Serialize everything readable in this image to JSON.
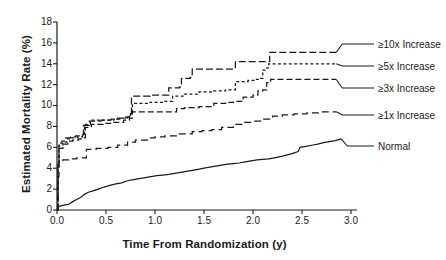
{
  "chart_data": {
    "type": "line",
    "title": "",
    "xlabel": "Time From Randomization (y)",
    "ylabel": "Estimated Mortality Rate (%)",
    "xlim": [
      0.0,
      3.0
    ],
    "ylim": [
      0,
      18
    ],
    "xticks": [
      "0.0",
      "0.5",
      "1.0",
      "1.5",
      "2.0",
      "2.5",
      "3.0"
    ],
    "yticks": [
      "0",
      "2",
      "4",
      "6",
      "8",
      "10",
      "12",
      "14",
      "16",
      "18"
    ],
    "grid": false,
    "legend_position": "right-inline-end-labels",
    "color": "#1a1a1a",
    "series": [
      {
        "name": "≥10x Increase",
        "label": "≥10x Increase",
        "dash": "7,3",
        "end_value": 15.1,
        "end_x": 2.85,
        "points": [
          [
            0.0,
            0.0
          ],
          [
            0.01,
            4.5
          ],
          [
            0.02,
            6.4
          ],
          [
            0.05,
            6.6
          ],
          [
            0.09,
            6.9
          ],
          [
            0.14,
            7.0
          ],
          [
            0.19,
            7.1
          ],
          [
            0.26,
            7.2
          ],
          [
            0.27,
            8.1
          ],
          [
            0.33,
            8.5
          ],
          [
            0.45,
            8.6
          ],
          [
            0.55,
            8.7
          ],
          [
            0.62,
            8.8
          ],
          [
            0.7,
            8.9
          ],
          [
            0.74,
            9.2
          ],
          [
            0.76,
            10.9
          ],
          [
            0.95,
            11.0
          ],
          [
            1.12,
            11.0
          ],
          [
            1.14,
            11.7
          ],
          [
            1.25,
            11.8
          ],
          [
            1.27,
            12.6
          ],
          [
            1.36,
            12.7
          ],
          [
            1.38,
            13.5
          ],
          [
            1.6,
            13.5
          ],
          [
            1.8,
            13.5
          ],
          [
            1.82,
            14.2
          ],
          [
            2.05,
            14.2
          ],
          [
            2.15,
            14.2
          ],
          [
            2.17,
            15.1
          ],
          [
            2.45,
            15.1
          ],
          [
            2.7,
            15.1
          ],
          [
            2.85,
            15.1
          ]
        ]
      },
      {
        "name": "≥5x Increase",
        "label": "≥5x Increase",
        "dash": "3,2.4",
        "end_value": 14.0,
        "end_x": 2.85,
        "points": [
          [
            0.0,
            0.0
          ],
          [
            0.01,
            4.3
          ],
          [
            0.02,
            6.2
          ],
          [
            0.06,
            6.5
          ],
          [
            0.1,
            6.8
          ],
          [
            0.15,
            6.9
          ],
          [
            0.21,
            7.0
          ],
          [
            0.26,
            7.1
          ],
          [
            0.28,
            8.2
          ],
          [
            0.34,
            8.6
          ],
          [
            0.46,
            8.6
          ],
          [
            0.58,
            8.7
          ],
          [
            0.66,
            8.8
          ],
          [
            0.72,
            8.9
          ],
          [
            0.75,
            9.3
          ],
          [
            0.77,
            10.2
          ],
          [
            0.95,
            10.3
          ],
          [
            1.1,
            10.4
          ],
          [
            1.18,
            10.9
          ],
          [
            1.3,
            11.1
          ],
          [
            1.45,
            11.3
          ],
          [
            1.6,
            11.4
          ],
          [
            1.72,
            11.5
          ],
          [
            1.8,
            11.5
          ],
          [
            1.82,
            12.3
          ],
          [
            1.95,
            12.4
          ],
          [
            2.02,
            12.5
          ],
          [
            2.08,
            12.6
          ],
          [
            2.1,
            13.4
          ],
          [
            2.14,
            13.6
          ],
          [
            2.16,
            14.0
          ],
          [
            2.4,
            14.0
          ],
          [
            2.65,
            14.0
          ],
          [
            2.85,
            14.0
          ]
        ]
      },
      {
        "name": "≥3x Increase",
        "label": "≥3x Increase",
        "dash": "6,3",
        "end_value": 12.5,
        "end_x": 2.85,
        "points": [
          [
            0.0,
            0.0
          ],
          [
            0.01,
            4.0
          ],
          [
            0.02,
            5.9
          ],
          [
            0.06,
            6.3
          ],
          [
            0.11,
            6.6
          ],
          [
            0.16,
            6.7
          ],
          [
            0.22,
            6.8
          ],
          [
            0.26,
            6.9
          ],
          [
            0.29,
            7.9
          ],
          [
            0.35,
            8.2
          ],
          [
            0.47,
            8.3
          ],
          [
            0.58,
            8.4
          ],
          [
            0.68,
            8.6
          ],
          [
            0.74,
            8.8
          ],
          [
            0.77,
            9.4
          ],
          [
            1.0,
            9.4
          ],
          [
            1.12,
            9.4
          ],
          [
            1.22,
            9.7
          ],
          [
            1.3,
            9.8
          ],
          [
            1.45,
            9.9
          ],
          [
            1.6,
            10.2
          ],
          [
            1.72,
            10.3
          ],
          [
            1.8,
            10.4
          ],
          [
            1.9,
            10.8
          ],
          [
            2.0,
            11.0
          ],
          [
            2.05,
            11.4
          ],
          [
            2.1,
            11.5
          ],
          [
            2.14,
            12.2
          ],
          [
            2.18,
            12.5
          ],
          [
            2.45,
            12.5
          ],
          [
            2.7,
            12.5
          ],
          [
            2.85,
            12.5
          ]
        ]
      },
      {
        "name": "≥1x Increase",
        "label": "≥1x Increase",
        "dash": "7,4",
        "end_value": 9.4,
        "end_x": 2.85,
        "points": [
          [
            0.0,
            0.0
          ],
          [
            0.01,
            3.2
          ],
          [
            0.02,
            4.6
          ],
          [
            0.06,
            4.8
          ],
          [
            0.12,
            4.9
          ],
          [
            0.2,
            5.0
          ],
          [
            0.27,
            5.0
          ],
          [
            0.3,
            5.8
          ],
          [
            0.4,
            5.9
          ],
          [
            0.52,
            6.0
          ],
          [
            0.62,
            6.2
          ],
          [
            0.72,
            6.5
          ],
          [
            0.8,
            6.7
          ],
          [
            0.92,
            6.9
          ],
          [
            1.0,
            7.0
          ],
          [
            1.1,
            7.1
          ],
          [
            1.25,
            7.3
          ],
          [
            1.38,
            7.5
          ],
          [
            1.48,
            7.6
          ],
          [
            1.58,
            7.7
          ],
          [
            1.68,
            7.9
          ],
          [
            1.8,
            8.2
          ],
          [
            1.9,
            8.4
          ],
          [
            2.0,
            8.5
          ],
          [
            2.1,
            8.7
          ],
          [
            2.2,
            9.0
          ],
          [
            2.3,
            9.1
          ],
          [
            2.42,
            9.2
          ],
          [
            2.55,
            9.3
          ],
          [
            2.7,
            9.4
          ],
          [
            2.85,
            9.4
          ]
        ]
      },
      {
        "name": "Normal",
        "label": "Normal",
        "dash": "none",
        "end_value": 6.8,
        "end_x": 2.9,
        "points": [
          [
            0.0,
            0.0
          ],
          [
            0.01,
            0.3
          ],
          [
            0.04,
            0.4
          ],
          [
            0.08,
            0.5
          ],
          [
            0.12,
            0.55
          ],
          [
            0.16,
            0.8
          ],
          [
            0.2,
            1.0
          ],
          [
            0.24,
            1.2
          ],
          [
            0.28,
            1.5
          ],
          [
            0.32,
            1.7
          ],
          [
            0.36,
            1.8
          ],
          [
            0.42,
            2.0
          ],
          [
            0.48,
            2.2
          ],
          [
            0.54,
            2.35
          ],
          [
            0.6,
            2.5
          ],
          [
            0.66,
            2.6
          ],
          [
            0.72,
            2.8
          ],
          [
            0.78,
            2.9
          ],
          [
            0.84,
            3.0
          ],
          [
            0.9,
            3.1
          ],
          [
            0.96,
            3.2
          ],
          [
            1.02,
            3.3
          ],
          [
            1.08,
            3.35
          ],
          [
            1.14,
            3.4
          ],
          [
            1.2,
            3.5
          ],
          [
            1.26,
            3.6
          ],
          [
            1.32,
            3.7
          ],
          [
            1.38,
            3.8
          ],
          [
            1.44,
            3.9
          ],
          [
            1.5,
            4.0
          ],
          [
            1.56,
            4.1
          ],
          [
            1.62,
            4.2
          ],
          [
            1.68,
            4.3
          ],
          [
            1.74,
            4.4
          ],
          [
            1.8,
            4.45
          ],
          [
            1.86,
            4.5
          ],
          [
            1.92,
            4.6
          ],
          [
            1.98,
            4.7
          ],
          [
            2.04,
            4.8
          ],
          [
            2.1,
            4.85
          ],
          [
            2.16,
            4.9
          ],
          [
            2.22,
            5.0
          ],
          [
            2.28,
            5.1
          ],
          [
            2.34,
            5.25
          ],
          [
            2.4,
            5.4
          ],
          [
            2.46,
            5.6
          ],
          [
            2.48,
            6.0
          ],
          [
            2.54,
            6.1
          ],
          [
            2.6,
            6.2
          ],
          [
            2.66,
            6.3
          ],
          [
            2.72,
            6.45
          ],
          [
            2.78,
            6.55
          ],
          [
            2.84,
            6.65
          ],
          [
            2.9,
            6.8
          ]
        ]
      }
    ]
  },
  "axis": {
    "x_title": "Time From Randomization (y)",
    "y_title": "Estimated Mortality Rate (%)"
  },
  "legend": {
    "items": [
      {
        "label": "≥10x Increase"
      },
      {
        "label": "≥5x Increase"
      },
      {
        "label": "≥3x Increase"
      },
      {
        "label": "≥1x Increase"
      },
      {
        "label": "Normal"
      }
    ]
  }
}
